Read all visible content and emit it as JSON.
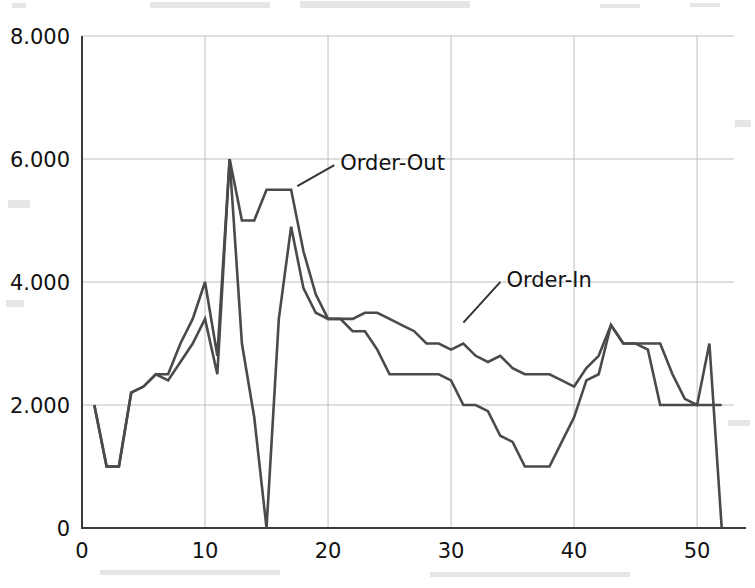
{
  "chart_data": {
    "type": "line",
    "title": "",
    "xlabel": "",
    "ylabel": "",
    "xlim": [
      0,
      53
    ],
    "ylim": [
      0,
      8000
    ],
    "grid": true,
    "legend_position": "inline-annotation",
    "xticks": [
      "0",
      "10",
      "20",
      "30",
      "40",
      "50"
    ],
    "xtick_values": [
      0,
      10,
      20,
      30,
      40,
      50
    ],
    "yticks": [
      "0",
      "2.000",
      "4.000",
      "6.000",
      "8.000"
    ],
    "ytick_values": [
      0,
      2000,
      4000,
      6000,
      8000
    ],
    "x": [
      1,
      2,
      3,
      4,
      5,
      6,
      7,
      8,
      9,
      10,
      11,
      12,
      13,
      14,
      15,
      16,
      17,
      18,
      19,
      20,
      21,
      22,
      23,
      24,
      25,
      26,
      27,
      28,
      29,
      30,
      31,
      32,
      33,
      34,
      35,
      36,
      37,
      38,
      39,
      40,
      41,
      42,
      43,
      44,
      45,
      46,
      47,
      48,
      49,
      50,
      51,
      52
    ],
    "series": [
      {
        "name": "Order-Out",
        "color": "#4a4a4a",
        "values": [
          2000,
          1000,
          1000,
          2200,
          2300,
          2500,
          2500,
          3000,
          3400,
          4000,
          2800,
          6000,
          5000,
          5000,
          5500,
          5500,
          5500,
          4500,
          3800,
          3400,
          3400,
          3400,
          3500,
          3500,
          3400,
          3300,
          3200,
          3000,
          3000,
          2900,
          3000,
          2800,
          2700,
          2800,
          2600,
          2500,
          2500,
          2500,
          2400,
          2300,
          2600,
          2800,
          3300,
          3000,
          3000,
          3000,
          3000,
          2500,
          2100,
          2000,
          3000,
          0
        ]
      },
      {
        "name": "Order-In",
        "color": "#4a4a4a",
        "values": [
          2000,
          1000,
          1000,
          2200,
          2300,
          2500,
          2400,
          2700,
          3000,
          3400,
          2500,
          6000,
          3000,
          1800,
          0,
          3400,
          4900,
          3900,
          3500,
          3400,
          3400,
          3200,
          3200,
          2900,
          2500,
          2500,
          2500,
          2500,
          2500,
          2400,
          2000,
          2000,
          1900,
          1500,
          1400,
          1000,
          1000,
          1000,
          1400,
          1800,
          2400,
          2500,
          3300,
          3000,
          3000,
          2900,
          2000,
          2000,
          2000,
          2000,
          2000,
          2000
        ]
      }
    ],
    "annotations": [
      {
        "text": "Order-Out",
        "x": 21,
        "y": 5950,
        "leader_to_x": 17.5,
        "leader_to_y": 5560
      },
      {
        "text": "Order-In",
        "x": 34.5,
        "y": 4050,
        "leader_to_x": 31.0,
        "leader_to_y": 3340
      }
    ]
  }
}
